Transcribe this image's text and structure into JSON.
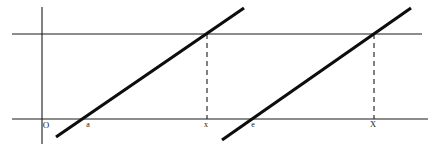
{
  "figure": {
    "background_color": "#ffffff",
    "line_color": "#0d0d0d",
    "axis_color": "#1a1a1a",
    "width": 433,
    "height": 150
  },
  "axes": {
    "y_axis": {
      "label": "",
      "x": 42,
      "y_top": 7,
      "y_bottom": 144
    },
    "x_axis": {
      "label": "",
      "y": 119,
      "x_left": 12,
      "x_right": 428
    },
    "reference_line": {
      "label": "",
      "y": 34,
      "x_left": 12,
      "x_right": 422
    }
  },
  "labels": [
    {
      "id": "origin",
      "text": "O",
      "x": 46,
      "y": 128
    },
    {
      "id": "a",
      "text": "a",
      "x": 88,
      "y": 127
    },
    {
      "id": "x-lower",
      "text": "x",
      "x": 206,
      "y": 127
    },
    {
      "id": "e",
      "text": "e",
      "x": 253,
      "y": 127
    },
    {
      "id": "X-upper",
      "text": "X",
      "x": 373,
      "y": 127
    }
  ],
  "segments": [
    {
      "id": "segment-1",
      "x1": 56,
      "y1": 137,
      "x2": 244,
      "y2": 8,
      "x_intercept": 82,
      "crossing_x": 207
    },
    {
      "id": "segment-2",
      "x1": 222,
      "y1": 140,
      "x2": 411,
      "y2": 8,
      "x_intercept": 250,
      "crossing_x": 374
    }
  ],
  "drop_lines": [
    {
      "id": "drop-line-1",
      "x": 207,
      "y_top": 34,
      "y_bottom": 119
    },
    {
      "id": "drop-line-2",
      "x": 374,
      "y_top": 34,
      "y_bottom": 119
    }
  ]
}
